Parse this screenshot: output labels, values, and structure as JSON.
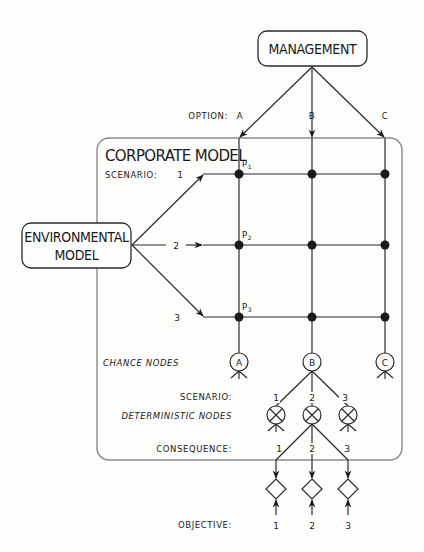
{
  "management": {
    "label": "MANAGEMENT"
  },
  "options": {
    "label": "OPTION:",
    "items": [
      "A",
      "B",
      "C"
    ]
  },
  "corporate_model": {
    "title": "CORPORATE MODEL",
    "scenario_label": "SCENARIO:",
    "scenarios": [
      "1",
      "2",
      "3"
    ],
    "points": [
      {
        "letter": "P",
        "sub": "1"
      },
      {
        "letter": "P",
        "sub": "2"
      },
      {
        "letter": "P",
        "sub": "3"
      }
    ]
  },
  "environmental_model": {
    "line1": "ENVIRONMENTAL",
    "line2": "MODEL"
  },
  "chance_nodes": {
    "label": "CHANCE NODES",
    "nodes": [
      "A",
      "B",
      "C"
    ]
  },
  "scenario_row": {
    "label": "SCENARIO:",
    "values": [
      "1",
      "2",
      "3"
    ]
  },
  "deterministic_nodes": {
    "label": "DETERMINISTIC NODES",
    "symbol": "×"
  },
  "consequence_row": {
    "label": "CONSEQUENCE:",
    "values": [
      "1",
      "2",
      "3"
    ]
  },
  "objective_row": {
    "label": "OBJECTIVE:",
    "values": [
      "1",
      "2",
      "3"
    ]
  },
  "colors": {
    "ink": "#1a1a1a",
    "frame": "#8a8a8a",
    "background": "#fdfdfb"
  }
}
